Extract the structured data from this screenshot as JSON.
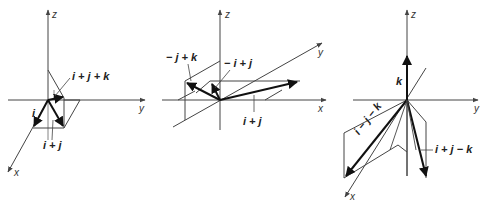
{
  "figures": [
    {
      "id": "left",
      "axes": {
        "z": "z",
        "y": "y",
        "x": "x"
      },
      "vectors": [
        {
          "label": "i",
          "name": "i"
        },
        {
          "label": "i + j",
          "name": "i-plus-j"
        },
        {
          "label": "i + j + k",
          "name": "i-plus-j-plus-k"
        }
      ]
    },
    {
      "id": "middle",
      "axes": {
        "z": "z",
        "y": "y",
        "x": "x"
      },
      "vectors": [
        {
          "label": "− j + k",
          "name": "neg-j-plus-k"
        },
        {
          "label": "− i + j",
          "name": "neg-i-plus-j"
        },
        {
          "label": "i + j",
          "name": "i-plus-j"
        }
      ]
    },
    {
      "id": "right",
      "axes": {
        "z": "z",
        "y": "y",
        "x": "x"
      },
      "vectors": [
        {
          "label": "k",
          "name": "k"
        },
        {
          "label": "i − j − k",
          "name": "i-minus-j-minus-k"
        },
        {
          "label": "i + j − k",
          "name": "i-plus-j-minus-k"
        }
      ]
    }
  ],
  "colors": {
    "line": "#444444",
    "vector": "#1a1a1a",
    "background": "#ffffff"
  }
}
